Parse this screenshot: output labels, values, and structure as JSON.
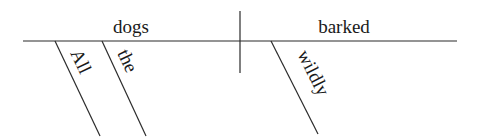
{
  "diagram": {
    "type": "sentence-diagram",
    "sentence": "All the dogs barked wildly",
    "subject": "dogs",
    "predicate": "barked",
    "modifiers": {
      "subject": [
        "All",
        "the"
      ],
      "predicate": [
        "wildly"
      ]
    }
  }
}
